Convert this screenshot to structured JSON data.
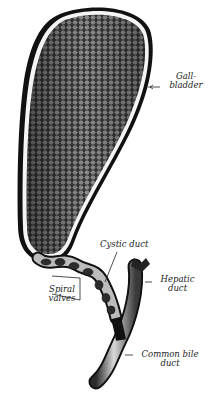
{
  "figure": {
    "labels": {
      "gallbladder": {
        "line1": "Gall-",
        "line2": "bladder"
      },
      "cystic_duct": "Cystic duct",
      "hepatic_duct": {
        "line1": "Hepatic",
        "line2": "duct"
      },
      "spiral_valves": {
        "line1": "Spiral",
        "line2": "valves"
      },
      "common_bile_duct": {
        "line1": "Common bile",
        "line2": "duct"
      }
    },
    "colors": {
      "background": "#ffffff",
      "outline": "#111111",
      "mucosa": "#4a4a4a",
      "highlight": "#e8e8e8"
    }
  }
}
